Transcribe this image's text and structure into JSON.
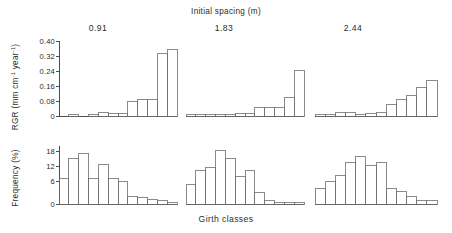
{
  "figure": {
    "title": "Initial spacing (m)",
    "xlabel": "Girth classes",
    "column_labels": [
      "0.91",
      "1.83",
      "2.44"
    ],
    "row_labels": {
      "top": "RGR (mm cm",
      "top_sup1": "-1",
      "top_mid": " year",
      "top_sup2": "-1",
      "top_end": ")",
      "bottom": "Frequency (%)"
    },
    "rgr_ticks": [
      "0.40",
      "0.32",
      "0.24",
      "0.16",
      "0.08",
      "0"
    ],
    "freq_ticks": [
      "18",
      "12",
      "6",
      "0"
    ]
  },
  "chart_data": [
    {
      "type": "bar",
      "title": "RGR — 0.91 m initial spacing",
      "panel": "rgr",
      "spacing": "0.91",
      "xlabel": "Girth classes",
      "ylabel": "RGR (mm cm-1 year-1)",
      "ylim": [
        0,
        0.4
      ],
      "yticks": [
        0,
        0.08,
        0.16,
        0.24,
        0.32,
        0.4
      ],
      "grid": false,
      "categories": [
        "1",
        "2",
        "3",
        "4",
        "5",
        "6",
        "7",
        "8",
        "9",
        "10",
        "11",
        "12"
      ],
      "values": [
        0.0,
        0.008,
        0.0,
        0.01,
        0.017,
        0.015,
        0.016,
        0.08,
        0.09,
        0.09,
        0.335,
        0.355
      ]
    },
    {
      "type": "bar",
      "title": "RGR — 1.83 m initial spacing",
      "panel": "rgr",
      "spacing": "1.83",
      "xlabel": "Girth classes",
      "ylabel": "RGR (mm cm-1 year-1)",
      "ylim": [
        0,
        0.4
      ],
      "yticks": [
        0,
        0.08,
        0.16,
        0.24,
        0.32,
        0.4
      ],
      "grid": false,
      "categories": [
        "1",
        "2",
        "3",
        "4",
        "5",
        "6",
        "7",
        "8",
        "9",
        "10",
        "11",
        "12"
      ],
      "values": [
        0.01,
        0.01,
        0.01,
        0.01,
        0.009,
        0.012,
        0.016,
        0.044,
        0.044,
        0.044,
        0.1,
        0.243
      ]
    },
    {
      "type": "bar",
      "title": "RGR — 2.44 m initial spacing",
      "panel": "rgr",
      "spacing": "2.44",
      "xlabel": "Girth classes",
      "ylabel": "RGR (mm cm-1 year-1)",
      "ylim": [
        0,
        0.4
      ],
      "yticks": [
        0,
        0.08,
        0.16,
        0.24,
        0.32,
        0.4
      ],
      "grid": false,
      "categories": [
        "1",
        "2",
        "3",
        "4",
        "5",
        "6",
        "7",
        "8",
        "9",
        "10",
        "11",
        "12"
      ],
      "values": [
        0.01,
        0.01,
        0.018,
        0.018,
        0.01,
        0.016,
        0.018,
        0.06,
        0.087,
        0.112,
        0.152,
        0.187
      ]
    },
    {
      "type": "bar",
      "title": "Frequency — 0.91 m initial spacing",
      "panel": "frequency",
      "spacing": "0.91",
      "xlabel": "Girth classes",
      "ylabel": "Frequency (%)",
      "ylim": [
        0,
        21
      ],
      "yticks": [
        0,
        6,
        12,
        18
      ],
      "grid": false,
      "categories": [
        "1",
        "2",
        "3",
        "4",
        "5",
        "6",
        "7",
        "8",
        "9",
        "10",
        "11",
        "12"
      ],
      "values": [
        9.3,
        16.5,
        18.3,
        9.3,
        14.2,
        9.3,
        8.2,
        2.6,
        2.2,
        1.6,
        1.2,
        0.5
      ]
    },
    {
      "type": "bar",
      "title": "Frequency — 1.83 m initial spacing",
      "panel": "frequency",
      "spacing": "1.83",
      "xlabel": "Girth classes",
      "ylabel": "Frequency (%)",
      "ylim": [
        0,
        21
      ],
      "yticks": [
        0,
        6,
        12,
        18
      ],
      "grid": false,
      "categories": [
        "1",
        "2",
        "3",
        "4",
        "5",
        "6",
        "7",
        "8",
        "9",
        "10",
        "11",
        "12"
      ],
      "values": [
        7.1,
        12.1,
        13.2,
        19.2,
        16.3,
        10.0,
        12.3,
        4.0,
        1.3,
        0.7,
        0.6,
        0.6
      ]
    },
    {
      "type": "bar",
      "title": "Frequency — 2.44 m initial spacing",
      "panel": "frequency",
      "spacing": "2.44",
      "xlabel": "Girth classes",
      "ylabel": "Frequency (%)",
      "ylim": [
        0,
        21
      ],
      "yticks": [
        0,
        6,
        12,
        18
      ],
      "grid": false,
      "categories": [
        "1",
        "2",
        "3",
        "4",
        "5",
        "6",
        "7",
        "8",
        "9",
        "10",
        "11",
        "12"
      ],
      "values": [
        5.6,
        8.1,
        10.3,
        15.2,
        17.3,
        14.1,
        15.2,
        5.7,
        4.4,
        2.8,
        1.3,
        1.3
      ]
    }
  ]
}
